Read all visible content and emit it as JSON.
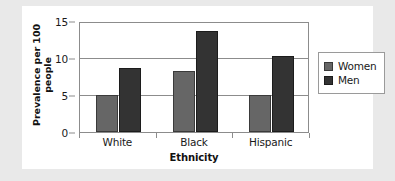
{
  "chart_data": {
    "type": "bar",
    "title": "",
    "xlabel": "Ethnicity",
    "ylabel": "Prevalence per 100 people",
    "ylabel_line1": "Prevalence per 100",
    "ylabel_line2": "people",
    "categories": [
      "White",
      "Black",
      "Hispanic"
    ],
    "series": [
      {
        "name": "Women",
        "values": [
          5.0,
          8.3,
          5.0
        ],
        "color": "#666666"
      },
      {
        "name": "Men",
        "values": [
          8.6,
          13.6,
          10.3
        ],
        "color": "#333333"
      }
    ],
    "ylim": [
      0,
      15
    ],
    "yticks": [
      0,
      5,
      10,
      15
    ],
    "ytick_labels": [
      "0",
      "5",
      "10",
      "15"
    ],
    "grid": true,
    "legend_position": "right",
    "legend_entries": [
      "Women",
      "Men"
    ]
  },
  "legend": {
    "women_label": "Women",
    "men_label": "Men"
  }
}
